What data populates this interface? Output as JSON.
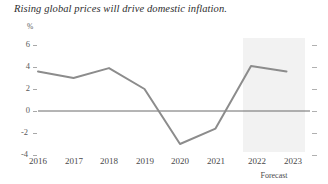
{
  "chart_data": {
    "type": "line",
    "title": "Rising global prices will drive domestic inflation.",
    "xlabel": "",
    "ylabel": "%",
    "categories": [
      "2016",
      "2017",
      "2018",
      "2019",
      "2020",
      "2021",
      "2022",
      "2023"
    ],
    "values": [
      3.6,
      3.0,
      3.9,
      2.0,
      -3.0,
      -1.6,
      4.1,
      3.6
    ],
    "series": [
      {
        "name": "Inflation",
        "values": [
          3.6,
          3.0,
          3.9,
          2.0,
          -3.0,
          -1.6,
          4.1,
          3.6
        ],
        "color": "#8c8c8c"
      }
    ],
    "ylim": [
      -5,
      7
    ],
    "yticks": [
      6,
      4,
      2,
      0,
      -2,
      -4
    ],
    "ytick_labels": [
      "6",
      "4",
      "2",
      "0",
      "-2",
      "-4"
    ],
    "zero_line": 0,
    "zero_line_color": "#6b6b6b",
    "grid": false,
    "legend": "none",
    "annotations": [
      {
        "text": "Forecast",
        "type": "shaded-region-label",
        "from": "2022",
        "to": "2023"
      }
    ],
    "shaded_region": {
      "label": "Forecast",
      "from": "2022",
      "to": "2023",
      "color": "#f2f2f2"
    }
  },
  "colors": {
    "line": "#8c8c8c",
    "zero_axis": "#6b6b6b",
    "tick": "#a8a8a8",
    "text": "#4a4a4a",
    "title": "#2d2d2d",
    "forecast_band": "#f2f2f2",
    "background": "#ffffff"
  }
}
